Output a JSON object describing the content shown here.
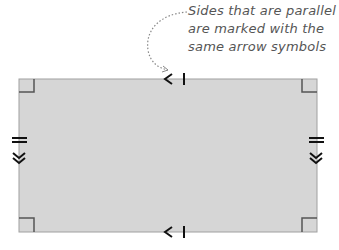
{
  "annotation": {
    "lines": [
      "Sides that are parallel",
      "are marked with the",
      "same arrow symbols"
    ]
  },
  "figure": {
    "shape": "rectangle",
    "fill": "#d6d6d6",
    "stroke": "#999999",
    "right_angle_markers": 4,
    "horizontal_side_marker": "single arrow with tick",
    "vertical_side_marker": "double arrow with double tick"
  }
}
